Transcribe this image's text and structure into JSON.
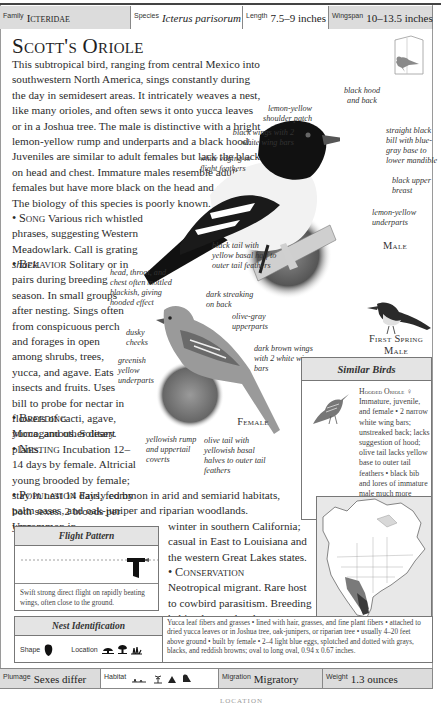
{
  "infobar": {
    "family": {
      "label": "Family",
      "value": "Icteridae"
    },
    "species": {
      "label": "Species",
      "value": "Icterus parisorum"
    },
    "length": {
      "label": "Length",
      "value": "7.5–9 inches"
    },
    "wingspan": {
      "label": "Wingspan",
      "value": "10–13.5 inches"
    }
  },
  "title": "Scott's Oriole",
  "intro": "This subtropical bird, ranging from central Mexico into southwestern North America, sings constantly during the day in semidesert areas. It intricately weaves a nest, like many orioles, and often sews it onto yucca leaves or in a Joshua tree. The male is distinctive with a bright lemon-yellow rump and underparts and a black hood. Juveniles are similar to adult females but lack the black on head and chest. Immature males resemble adult females but have more black on the head and chest. The biology of this species is poorly known.",
  "sections": {
    "song": {
      "heading": "Song",
      "text": "Various rich whistled phrases, suggesting Western Meadowlark. Call is grating ",
      "call": "shack",
      "end": "."
    },
    "behavior": {
      "heading": "Behavior",
      "text": "Solitary or in pairs during breeding season. In small groups after nesting. Sings often from conspicuous perch and forages in open among shrubs, trees, yucca, and agave. Eats insects and fruits. Uses bill to probe for nectar in flowers of cacti, agave, yucca, and other desert plants."
    },
    "breeding": {
      "heading": "Breeding",
      "text": "Monogamous. Solitary."
    },
    "nesting": {
      "heading": "Nesting",
      "text": "Incubation 12–14 days by female. Altricial young brooded by female; stay in nest 14 days, fed by both sexes. 2 broods per year."
    },
    "population": {
      "heading": "Population",
      "text": "Fairly common in arid and semiarid habitats, palm oases, and oak-juniper and riparian woodlands. Uncommon in",
      "text2": "winter in southern California; casual in East to Louisiana and the western Great Lakes states."
    },
    "conservation": {
      "heading": "Conservation",
      "text": "Neotropical migrant. Rare host to cowbird parasitism. Breeding habitat lost to development."
    }
  },
  "annotations": {
    "male": [
      "black hood and back",
      "lemon-yellow shoulder patch",
      "black wings with 2 white wing bars",
      "white edging to flight feathers",
      "straight black bill with blue-gray base to lower mandible",
      "black upper breast",
      "lemon-yellow underparts",
      "black tail with yellow basal half to outer tail feathers"
    ],
    "female": [
      "head, throat, and chest often mottled blackish, giving hooded effect",
      "dark streaking on back",
      "olive-gray upperparts",
      "dusky cheeks",
      "greenish yellow underparts",
      "dark brown wings with 2 white wing bars",
      "yellowish rump and uppertail coverts",
      "olive tail with yellowish basal halves to outer tail feathers"
    ]
  },
  "bird_labels": {
    "male": "Male",
    "female": "Female",
    "first_spring_male": "First Spring Male"
  },
  "similar_birds": {
    "heading": "Similar Birds",
    "name": "Hooded Oriole",
    "sex_symbol": "♀",
    "text": "Immature, juvenile, and female • 2 narrow white wing bars; unstreaked back; lacks suggestion of hood; olive tail lacks yellow base to outer tail feathers • black bib and lores of immature male much more reduced than on immature male Scott's Oriole."
  },
  "flight_pattern": {
    "heading": "Flight Pattern",
    "text": "Swift strong direct flight on rapidly beating wings, often close to the ground."
  },
  "nest_identification": {
    "heading": "Nest Identification",
    "shape_label": "Shape",
    "location_label": "Location",
    "text": "Yucca leaf fibers and grasses • lined with hair, grasses, and fine plant fibers • attached to dried yucca leaves or in Joshua tree, oak-junipers, or riparian tree • usually 4–20 feet above ground • built by female • 2–4 light blue eggs, splotched and dotted with grays, blacks, and reddish browns; oval to long oval, 0.94 x 0.67 inches."
  },
  "bottombar": {
    "plumage": {
      "label": "Plumage",
      "value": "Sexes differ"
    },
    "habitat": {
      "label": "Habitat",
      "icons": [
        "desert-scrub-icon",
        "palm-icon",
        "mountain-icon",
        "woodland-icon"
      ]
    },
    "migration": {
      "label": "Migration",
      "value": "Migratory"
    },
    "weight": {
      "label": "Weight",
      "value": "1.3 ounces"
    }
  },
  "footer": "LOCATION",
  "colors": {
    "shaded_cell": "#dcdcdc",
    "box_header": "#e4e4e4",
    "border": "#888888",
    "range_dark": "#3a3a3a",
    "range_mid": "#7a7a7a"
  }
}
